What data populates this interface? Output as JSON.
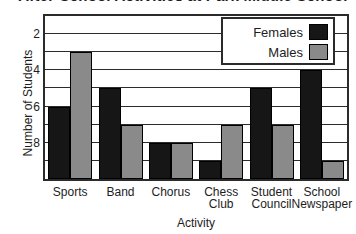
{
  "title": "After-School Activities at Park Middle School",
  "chart_data": {
    "type": "bar",
    "title": "After-School Activities at Park Middle School",
    "xlabel": "Activity",
    "ylabel": "Number of Students",
    "categories": [
      "Sports",
      "Band",
      "Chorus",
      "Chess Club",
      "Student Council",
      "School Newspaper"
    ],
    "series": [
      {
        "name": "Females",
        "color": "#161616",
        "values": [
          4,
          5,
          2,
          1,
          5,
          6
        ]
      },
      {
        "name": "Males",
        "color": "#8a8a8a",
        "values": [
          7,
          3,
          2,
          3,
          3,
          1
        ]
      }
    ],
    "ylim": [
      0,
      9
    ],
    "yticks": [
      2,
      4,
      6,
      8
    ],
    "ytick_labels": [
      "2",
      "4",
      "6",
      "8"
    ],
    "gridlines": [
      1,
      2,
      3,
      4,
      5,
      6,
      7,
      8,
      9
    ],
    "grid": true,
    "legend_position": "upper-right",
    "legend_entries": [
      "Females",
      "Males"
    ]
  },
  "axes": {
    "y_label": "Number of Students",
    "x_label": "Activity",
    "y_ticks": [
      "2",
      "4",
      "6",
      "8"
    ]
  },
  "legend": {
    "entries": [
      {
        "label": "Females",
        "swatch": "black-swatch"
      },
      {
        "label": "Males",
        "swatch": "gray-swatch"
      }
    ]
  },
  "x_categories": [
    {
      "line1": "Sports",
      "line2": ""
    },
    {
      "line1": "Band",
      "line2": ""
    },
    {
      "line1": "Chorus",
      "line2": ""
    },
    {
      "line1": "Chess",
      "line2": "Club"
    },
    {
      "line1": "Student",
      "line2": "Council"
    },
    {
      "line1": "School",
      "line2": "Newspaper"
    }
  ]
}
